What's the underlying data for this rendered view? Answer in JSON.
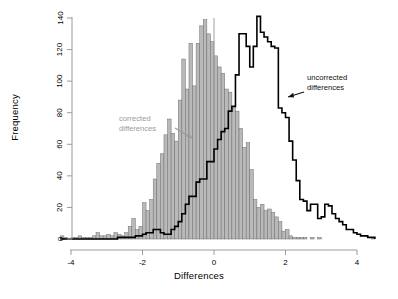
{
  "figure": {
    "background": "#ffffff"
  },
  "axes": {
    "xlabel": "Differences",
    "ylabel": "Frequency",
    "x_ticks": [
      "-4",
      "-2",
      "0",
      "2",
      "4"
    ],
    "y_ticks": [
      "0",
      "20",
      "40",
      "60",
      "80",
      "100",
      "120",
      "140"
    ],
    "axis_color": "#9b9b9b",
    "tick_color": "#000000"
  },
  "annotations": [
    {
      "name": "corrected-differences",
      "line1": "corrected",
      "line2": "differences",
      "color": "#9a9a9a"
    },
    {
      "name": "uncorrected-differences",
      "line1": "uncorrected",
      "line2": "differences",
      "color": "#111111"
    }
  ],
  "chart_data": {
    "type": "bar",
    "title": "",
    "xlabel": "Differences",
    "ylabel": "Frequency",
    "xlim": [
      -4.3,
      4.7
    ],
    "ylim": [
      0,
      145
    ],
    "grid": false,
    "legend": "inline annotations with arrows",
    "bin_width": 0.1,
    "reference_line": {
      "x": 0,
      "color": "#9b9b9b"
    },
    "series": [
      {
        "name": "corrected differences",
        "style": "filled-histogram",
        "fill": "#b9b9b9",
        "edge": "#6e6e6e",
        "bin_centers": [
          -4.25,
          -4.15,
          -4.05,
          -3.95,
          -3.85,
          -3.75,
          -3.65,
          -3.55,
          -3.45,
          -3.35,
          -3.25,
          -3.15,
          -3.05,
          -2.95,
          -2.85,
          -2.75,
          -2.65,
          -2.55,
          -2.45,
          -2.35,
          -2.25,
          -2.15,
          -2.05,
          -1.95,
          -1.85,
          -1.75,
          -1.65,
          -1.55,
          -1.45,
          -1.35,
          -1.25,
          -1.15,
          -1.05,
          -0.95,
          -0.85,
          -0.75,
          -0.65,
          -0.55,
          -0.45,
          -0.35,
          -0.25,
          -0.15,
          -0.05,
          0.05,
          0.15,
          0.25,
          0.35,
          0.45,
          0.55,
          0.65,
          0.75,
          0.85,
          0.95,
          1.05,
          1.15,
          1.25,
          1.35,
          1.45,
          1.55,
          1.65,
          1.75,
          1.85,
          1.95,
          2.05,
          2.15,
          2.25,
          2.35,
          2.45,
          2.55,
          2.65,
          2.75,
          2.85,
          2.95,
          3.05,
          3.15,
          3.25,
          3.35,
          3.45,
          3.55,
          3.65,
          3.75,
          3.85,
          3.95,
          4.05,
          4.15,
          4.25,
          4.35,
          4.45
        ],
        "values": [
          2,
          1,
          0,
          1,
          1,
          2,
          1,
          1,
          1,
          2,
          4,
          2,
          2,
          3,
          2,
          4,
          3,
          2,
          4,
          8,
          13,
          6,
          8,
          23,
          18,
          25,
          38,
          48,
          54,
          66,
          76,
          67,
          62,
          88,
          114,
          95,
          124,
          97,
          124,
          135,
          139,
          130,
          125,
          116,
          109,
          105,
          95,
          93,
          84,
          81,
          70,
          58,
          61,
          44,
          25,
          20,
          22,
          18,
          19,
          17,
          14,
          11,
          5,
          6,
          2,
          1,
          1,
          1,
          1,
          0,
          1,
          0,
          1,
          0,
          0,
          0,
          0,
          0,
          0,
          0,
          0,
          0,
          0,
          0,
          0,
          0,
          0,
          1
        ]
      },
      {
        "name": "uncorrected differences",
        "style": "step-outline",
        "color": "#000000",
        "bin_centers": [
          -4.25,
          -4.15,
          -4.05,
          -3.95,
          -3.85,
          -3.75,
          -3.65,
          -3.55,
          -3.45,
          -3.35,
          -3.25,
          -3.15,
          -3.05,
          -2.95,
          -2.85,
          -2.75,
          -2.65,
          -2.55,
          -2.45,
          -2.35,
          -2.25,
          -2.15,
          -2.05,
          -1.95,
          -1.85,
          -1.75,
          -1.65,
          -1.55,
          -1.45,
          -1.35,
          -1.25,
          -1.15,
          -1.05,
          -0.95,
          -0.85,
          -0.75,
          -0.65,
          -0.55,
          -0.45,
          -0.35,
          -0.25,
          -0.15,
          -0.05,
          0.05,
          0.15,
          0.25,
          0.35,
          0.45,
          0.55,
          0.65,
          0.75,
          0.85,
          0.95,
          1.05,
          1.15,
          1.25,
          1.35,
          1.45,
          1.55,
          1.65,
          1.75,
          1.85,
          1.95,
          2.05,
          2.15,
          2.25,
          2.35,
          2.45,
          2.55,
          2.65,
          2.75,
          2.85,
          2.95,
          3.05,
          3.15,
          3.25,
          3.35,
          3.45,
          3.55,
          3.65,
          3.75,
          3.85,
          3.95,
          4.05,
          4.15,
          4.25,
          4.35,
          4.45
        ],
        "values": [
          0,
          0,
          0,
          0,
          0,
          0,
          0,
          0,
          0,
          0,
          0,
          0,
          0,
          0,
          0,
          0,
          1,
          1,
          1,
          1,
          1,
          2,
          2,
          3,
          4,
          4,
          6,
          6,
          4,
          3,
          3,
          6,
          8,
          11,
          16,
          22,
          27,
          27,
          36,
          38,
          38,
          49,
          49,
          57,
          63,
          68,
          70,
          81,
          84,
          104,
          130,
          130,
          122,
          109,
          122,
          141,
          131,
          128,
          125,
          122,
          121,
          83,
          80,
          77,
          62,
          50,
          37,
          25,
          24,
          18,
          22,
          22,
          13,
          14,
          22,
          21,
          16,
          13,
          11,
          9,
          6,
          6,
          4,
          3,
          2,
          2,
          1,
          1
        ]
      }
    ]
  }
}
